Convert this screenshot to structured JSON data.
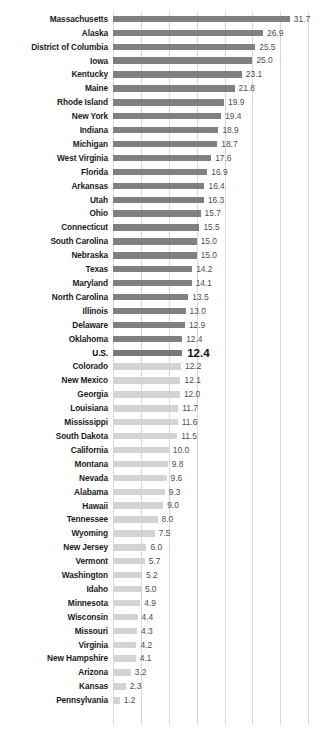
{
  "chart_data": {
    "type": "bar",
    "orientation": "horizontal",
    "title": "",
    "subtitle": "",
    "xlabel": "",
    "ylabel": "",
    "xlim": [
      0,
      35.5
    ],
    "grid": true,
    "gridlines_x": [
      0,
      5,
      10,
      15,
      20,
      25,
      30,
      35
    ],
    "legend": "none",
    "sort": "descending",
    "value_format": "one-decimal",
    "highlight_category": "U.S.",
    "colors": {
      "bar_above_us": "#8c8c8e",
      "bar_us": "#787879",
      "bar_below_us": "#d3d3d6",
      "gridline": "#d8d8da",
      "label_text": "#1a1a1a",
      "value_text": "#4e4e50"
    },
    "categories": [
      "Massachusetts",
      "Alaska",
      "District of Columbia",
      "Iowa",
      "Kentucky",
      "Maine",
      "Rhode Island",
      "New York",
      "Indiana",
      "Michigan",
      "West Virginia",
      "Florida",
      "Arkansas",
      "Utah",
      "Ohio",
      "Connecticut",
      "South Carolina",
      "Nebraska",
      "Texas",
      "Maryland",
      "North Carolina",
      "Illinois",
      "Delaware",
      "Oklahoma",
      "U.S.",
      "Colorado",
      "New Mexico",
      "Georgia",
      "Louisiana",
      "Mississippi",
      "South Dakota",
      "California",
      "Montana",
      "Nevada",
      "Alabama",
      "Hawaii",
      "Tennessee",
      "Wyoming",
      "New Jersey",
      "Vermont",
      "Washington",
      "Idaho",
      "Minnesota",
      "Wisconsin",
      "Missouri",
      "Virginia",
      "New Hampshire",
      "Arizona",
      "Kansas",
      "Pennsylvania"
    ],
    "values": [
      31.7,
      26.9,
      25.5,
      25.0,
      23.1,
      21.8,
      19.9,
      19.4,
      18.9,
      18.7,
      17.6,
      16.9,
      16.4,
      16.3,
      15.7,
      15.5,
      15.0,
      15.0,
      14.2,
      14.1,
      13.5,
      13.0,
      12.9,
      12.4,
      12.4,
      12.2,
      12.1,
      12.0,
      11.7,
      11.6,
      11.5,
      10.0,
      9.8,
      9.6,
      9.3,
      9.0,
      8.0,
      7.5,
      6.0,
      5.7,
      5.2,
      5.0,
      4.9,
      4.4,
      4.3,
      4.2,
      4.1,
      3.2,
      2.3,
      1.2
    ],
    "value_labels": [
      "31.7",
      "26.9",
      "25.5",
      "25.0",
      "23.1",
      "21.8",
      "19.9",
      "19.4",
      "18.9",
      "18.7",
      "17.6",
      "16.9",
      "16.4",
      "16.3",
      "15.7",
      "15.5",
      "15.0",
      "15.0",
      "14.2",
      "14.1",
      "13.5",
      "13.0",
      "12.9",
      "12.4",
      "12.4",
      "12.2",
      "12.1",
      "12.0",
      "11.7",
      "11.6",
      "11.5",
      "10.0",
      "9.8",
      "9.6",
      "9.3",
      "9.0",
      "8.0",
      "7.5",
      "6.0",
      "5.7",
      "5.2",
      "5.0",
      "4.9",
      "4.4",
      "4.3",
      "4.2",
      "4.1",
      "3.2",
      "2.3",
      "1.2"
    ]
  }
}
